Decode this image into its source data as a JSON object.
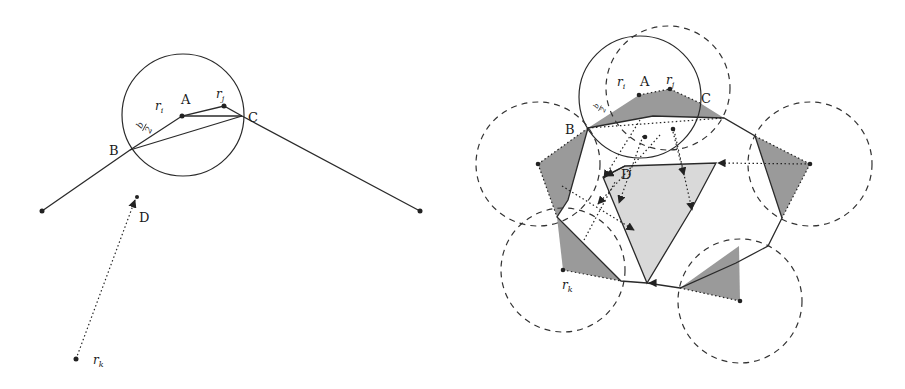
{
  "figure_left": {
    "labels": {
      "A": "A",
      "B": "B",
      "C": "C",
      "D": "D",
      "ri": "r",
      "ri_sub": "i",
      "rj": "r",
      "rj_sub": "j",
      "rk": "r",
      "rk_sub": "k",
      "b_half_num": "b",
      "b_half_den": "2"
    }
  },
  "figure_right": {
    "labels": {
      "A": "A",
      "B": "B",
      "C": "C",
      "D": "D",
      "ri": "r",
      "ri_sub": "i",
      "rj": "r",
      "rj_sub": "j",
      "rk": "r",
      "rk_sub": "k",
      "b_half_num": "b",
      "b_half_den": "2"
    },
    "colors": {
      "dark_fill": "#9a9a9a",
      "light_fill": "#d9d9d9",
      "stroke": "#2a2a2a"
    }
  }
}
